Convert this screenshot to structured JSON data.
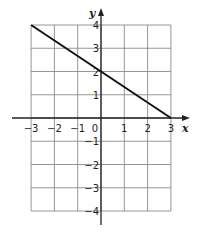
{
  "chart_data": {
    "type": "line",
    "title": "",
    "xlabel": "x",
    "ylabel": "y",
    "xlim": [
      -3,
      3
    ],
    "ylim": [
      -4,
      4
    ],
    "grid": true,
    "x_ticks": [
      -3,
      -2,
      -1,
      0,
      1,
      2,
      3
    ],
    "y_ticks": [
      -4,
      -3,
      -2,
      -1,
      1,
      2,
      3,
      4
    ],
    "x_tick_labels": [
      "−3",
      "−2",
      "−1",
      "0",
      "1",
      "2",
      "3"
    ],
    "y_tick_labels": [
      "−4",
      "−3",
      "−2",
      "−1",
      "1",
      "2",
      "3",
      "4"
    ],
    "series": [
      {
        "name": "line",
        "x": [
          -3,
          0,
          3
        ],
        "y": [
          4,
          2,
          0
        ],
        "slope": -0.6667,
        "intercept": 2
      }
    ],
    "colors": {
      "line": "#111111",
      "grid": "#8a8a8a",
      "axis": "#222222"
    }
  }
}
